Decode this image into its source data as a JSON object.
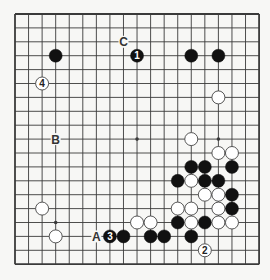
{
  "diagram": {
    "type": "go-board",
    "size": 19,
    "geometry": {
      "left": 15,
      "top": 14,
      "dx": 13.56,
      "dy": 13.9,
      "stone_radius": 6.5
    },
    "colors": {
      "background": "#f7f7f5",
      "line": "#3a3a3a",
      "black": "#111111",
      "white": "#ffffff",
      "white_stroke": "#444444"
    },
    "hoshi": [
      [
        3,
        3
      ],
      [
        9,
        3
      ],
      [
        15,
        3
      ],
      [
        3,
        9
      ],
      [
        9,
        9
      ],
      [
        15,
        9
      ],
      [
        3,
        15
      ],
      [
        9,
        15
      ],
      [
        15,
        15
      ]
    ],
    "stones": [
      {
        "color": "black",
        "col": 3,
        "row": 3,
        "label": ""
      },
      {
        "color": "black",
        "col": 9,
        "row": 3,
        "label": "1"
      },
      {
        "color": "black",
        "col": 13,
        "row": 3,
        "label": ""
      },
      {
        "color": "black",
        "col": 15,
        "row": 3,
        "label": ""
      },
      {
        "color": "white",
        "col": 2,
        "row": 5,
        "label": "4"
      },
      {
        "color": "white",
        "col": 15,
        "row": 6,
        "label": ""
      },
      {
        "color": "white",
        "col": 13,
        "row": 9,
        "label": ""
      },
      {
        "color": "white",
        "col": 15,
        "row": 10,
        "label": ""
      },
      {
        "color": "white",
        "col": 16,
        "row": 10,
        "label": ""
      },
      {
        "color": "black",
        "col": 13,
        "row": 11,
        "label": ""
      },
      {
        "color": "black",
        "col": 14,
        "row": 11,
        "label": ""
      },
      {
        "color": "black",
        "col": 16,
        "row": 11,
        "label": ""
      },
      {
        "color": "black",
        "col": 12,
        "row": 12,
        "label": ""
      },
      {
        "color": "white",
        "col": 13,
        "row": 12,
        "label": ""
      },
      {
        "color": "black",
        "col": 14,
        "row": 12,
        "label": ""
      },
      {
        "color": "black",
        "col": 15,
        "row": 12,
        "label": ""
      },
      {
        "color": "white",
        "col": 14,
        "row": 13,
        "label": ""
      },
      {
        "color": "white",
        "col": 15,
        "row": 13,
        "label": ""
      },
      {
        "color": "black",
        "col": 16,
        "row": 13,
        "label": ""
      },
      {
        "color": "white",
        "col": 2,
        "row": 14,
        "label": ""
      },
      {
        "color": "white",
        "col": 12,
        "row": 14,
        "label": ""
      },
      {
        "color": "white",
        "col": 13,
        "row": 14,
        "label": ""
      },
      {
        "color": "white",
        "col": 15,
        "row": 14,
        "label": ""
      },
      {
        "color": "black",
        "col": 16,
        "row": 14,
        "label": ""
      },
      {
        "color": "white",
        "col": 9,
        "row": 15,
        "label": ""
      },
      {
        "color": "white",
        "col": 10,
        "row": 15,
        "label": ""
      },
      {
        "color": "black",
        "col": 12,
        "row": 15,
        "label": ""
      },
      {
        "color": "white",
        "col": 13,
        "row": 15,
        "label": ""
      },
      {
        "color": "black",
        "col": 14,
        "row": 15,
        "label": ""
      },
      {
        "color": "white",
        "col": 15,
        "row": 15,
        "label": ""
      },
      {
        "color": "white",
        "col": 16,
        "row": 15,
        "label": ""
      },
      {
        "color": "white",
        "col": 3,
        "row": 16,
        "label": ""
      },
      {
        "color": "black",
        "col": 7,
        "row": 16,
        "label": "3"
      },
      {
        "color": "black",
        "col": 8,
        "row": 16,
        "label": ""
      },
      {
        "color": "black",
        "col": 10,
        "row": 16,
        "label": ""
      },
      {
        "color": "black",
        "col": 11,
        "row": 16,
        "label": ""
      },
      {
        "color": "black",
        "col": 13,
        "row": 16,
        "label": ""
      },
      {
        "color": "white",
        "col": 14,
        "row": 17,
        "label": "2"
      }
    ],
    "markers": [
      {
        "label": "C",
        "col": 8,
        "row": 2
      },
      {
        "label": "B",
        "col": 3,
        "row": 9
      },
      {
        "label": "A",
        "col": 6,
        "row": 16
      }
    ]
  }
}
